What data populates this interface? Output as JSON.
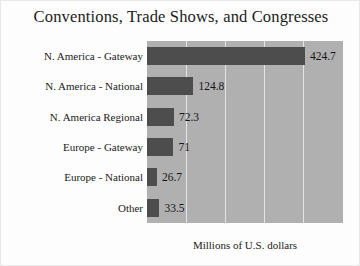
{
  "chart_data": {
    "type": "bar",
    "orientation": "horizontal",
    "title": "Conventions, Trade Shows, and Congresses",
    "xlabel": "Millions of U.S. dollars",
    "ylabel": "",
    "categories": [
      "N. America - Gateway",
      "N. America - National",
      "N. America Regional",
      "Europe - Gateway",
      "Europe - National",
      "Other"
    ],
    "values": [
      424.7,
      124.8,
      72.3,
      71,
      26.7,
      33.5
    ],
    "value_labels": [
      "424.7",
      "124.8",
      "72.3",
      "71",
      "26.7",
      "33.5"
    ],
    "xlim": [
      0,
      527
    ],
    "grid": true,
    "gridline_count": 4,
    "legend": null,
    "colors": {
      "bar": "#4d4d4d",
      "plot_background": "#b0b0b0",
      "gridline": "#e4e4e4",
      "figure_background": "#fdfdfd",
      "text": "#1b1b1b"
    }
  }
}
